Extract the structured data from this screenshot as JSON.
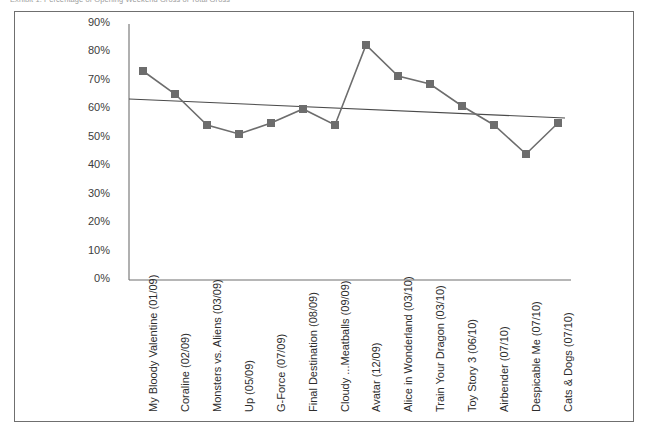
{
  "figure": {
    "caption": "Exhibit 1. Percentage of Opening Weekend Gross of Total Gross"
  },
  "chart_data": {
    "type": "line",
    "title": "Exhibit 1. Percentage of Opening Weekend Gross of Total Gross",
    "xlabel": "",
    "ylabel": "",
    "ylim": [
      0,
      90
    ],
    "yticks": [
      0,
      10,
      20,
      30,
      40,
      50,
      60,
      70,
      80,
      90
    ],
    "ytick_labels": [
      "0%",
      "10%",
      "20%",
      "30%",
      "40%",
      "50%",
      "60%",
      "70%",
      "80%",
      "90%"
    ],
    "grid": false,
    "legend": "none",
    "marker": "square",
    "series_color": "#6d6d6d",
    "trendline_color": "#4a4a4a",
    "categories": [
      "My Bloody Valentine (01/09)",
      "Coraline (02/09)",
      "Monsters vs. Aliens (03/09)",
      "Up (05/09)",
      "G-Force (07/09)",
      "Final Destination (08/09)",
      "Cloudy ...Meatballs (09/09)",
      "Avatar (12/09)",
      "Alice in Wonderland (03/10)",
      "Train Your Dragon (03/10)",
      "Toy Story 3 (06/10)",
      "Airbender (07/10)",
      "Despicable Me (07/10)",
      "Cats & Dogs (07/10)"
    ],
    "series": [
      {
        "name": "Opening Weekend % of Total Gross",
        "values": [
          73,
          65,
          54,
          51,
          55,
          60,
          54,
          82,
          71,
          68,
          60,
          54,
          45,
          55
        ]
      }
    ],
    "trendline": {
      "name": "Linear trend",
      "start_value": 65,
      "end_value": 58
    }
  }
}
